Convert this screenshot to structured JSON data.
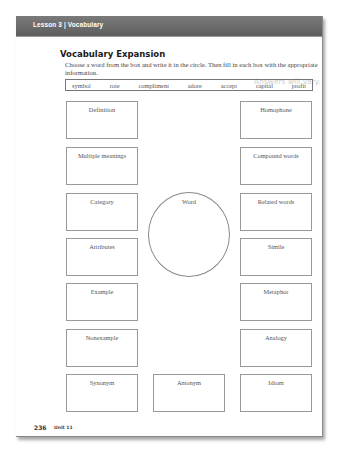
{
  "header": {
    "title": "Lesson 3 | Vocabulary"
  },
  "section": {
    "title": "Vocabulary Expansion",
    "instructions": "Choose a word from the box and write it in the circle. Then fill in each box with the appropriate information.",
    "answers_note": "Answers will vary."
  },
  "word_box": [
    "symbol",
    "rote",
    "compliment",
    "adore",
    "accept",
    "capital",
    "profit"
  ],
  "center": {
    "label": "Word"
  },
  "left_boxes": [
    {
      "label": "Definition"
    },
    {
      "label": "Multiple meanings"
    },
    {
      "label": "Category"
    },
    {
      "label": "Attributes"
    },
    {
      "label": "Example"
    },
    {
      "label": "Nonexample"
    },
    {
      "label": "Synonym"
    }
  ],
  "right_boxes": [
    {
      "label": "Homophone"
    },
    {
      "label": "Compound words"
    },
    {
      "label": "Related words"
    },
    {
      "label": "Simile"
    },
    {
      "label": "Metaphor"
    },
    {
      "label": "Analogy"
    },
    {
      "label": "Idiom"
    }
  ],
  "bottom_center_box": {
    "label": "Antonym"
  },
  "footer": {
    "page_number": "236",
    "unit": "Unit 11"
  }
}
